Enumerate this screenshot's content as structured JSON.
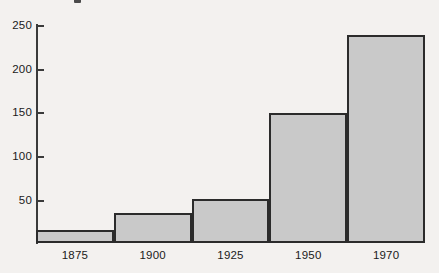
{
  "chart_data": {
    "type": "bar",
    "title": "",
    "subtitle": "",
    "xlabel": "",
    "ylabel": "",
    "categories": [
      "1875",
      "1900",
      "1925",
      "1950",
      "1970"
    ],
    "values": [
      15,
      34,
      50,
      148,
      237
    ],
    "series": [
      {
        "name": "",
        "values": [
          15,
          34,
          50,
          148,
          237
        ]
      }
    ],
    "ylim": [
      0,
      250
    ],
    "xlim": [
      0,
      5
    ],
    "y_ticks": [
      50,
      100,
      150,
      200,
      250
    ],
    "y_tick_labels": [
      "50",
      "100",
      "150",
      "200",
      "250"
    ],
    "x_tick_labels": [
      "1875",
      "1900",
      "1925",
      "1950",
      "1970"
    ],
    "grid": false,
    "legend": false,
    "legend_position": "none",
    "bar_gap": 0,
    "annotations": [],
    "colors": {
      "bar_fill": "#c9c9c9",
      "bar_stroke": "#2b2b2b",
      "axis": "#3a3a3a",
      "text": "#1a1a1a",
      "background": "#f3f1ef"
    }
  },
  "axis": {
    "ticks": [
      {
        "label": "250",
        "value": 250
      },
      {
        "label": "200",
        "value": 200
      },
      {
        "label": "150",
        "value": 150
      },
      {
        "label": "100",
        "value": 100
      },
      {
        "label": "50",
        "value": 50
      }
    ]
  },
  "bars": [
    {
      "label": "1875",
      "value": 15
    },
    {
      "label": "1900",
      "value": 34
    },
    {
      "label": "1925",
      "value": 50
    },
    {
      "label": "1950",
      "value": 148
    },
    {
      "label": "1970",
      "value": 237
    }
  ]
}
